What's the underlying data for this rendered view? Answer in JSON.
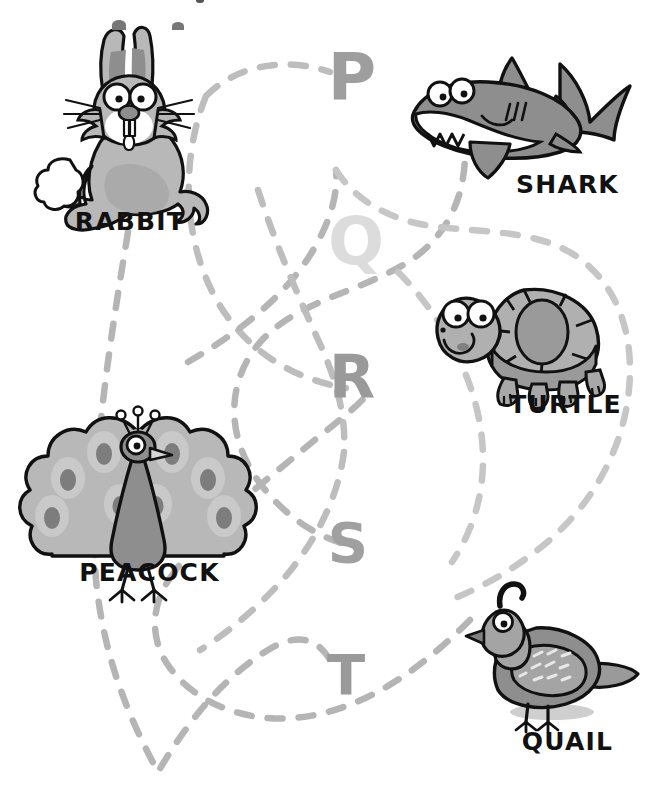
{
  "worksheet": {
    "type": "alphabet-match-worksheet",
    "width": 664,
    "height": 810,
    "background": "#ffffff",
    "line_color": "#b3b3b3",
    "letter_color": "#9a9a9a",
    "letter_color_faint": "#d9d9d9",
    "label_color": "#111111"
  },
  "letters": [
    {
      "id": "letter-p",
      "char": "P",
      "x": 352,
      "y": 72,
      "size": 62,
      "color": "#9e9e9e"
    },
    {
      "id": "letter-q",
      "char": "Q",
      "x": 354,
      "y": 237,
      "size": 62,
      "color": "#dcdcdc"
    },
    {
      "id": "letter-r",
      "char": "R",
      "x": 350,
      "y": 373,
      "size": 58,
      "color": "#9a9a9a"
    },
    {
      "id": "letter-s",
      "char": "S",
      "x": 346,
      "y": 541,
      "size": 52,
      "color": "#a0a0a0"
    },
    {
      "id": "letter-t",
      "char": "T",
      "x": 344,
      "y": 674,
      "size": 52,
      "color": "#9a9a9a"
    }
  ],
  "animals": [
    {
      "id": "rabbit",
      "label": "RABBIT",
      "label_x": 30,
      "label_y": 207,
      "label_w": 200
    },
    {
      "id": "shark",
      "label": "SHARK",
      "label_x": 470,
      "label_y": 170,
      "label_w": 195
    },
    {
      "id": "turtle",
      "label": "TURTLE",
      "label_x": 468,
      "label_y": 390,
      "label_w": 195
    },
    {
      "id": "peacock",
      "label": "PEACOCK",
      "label_x": 42,
      "label_y": 558,
      "label_w": 215
    },
    {
      "id": "quail",
      "label": "QUAIL",
      "label_x": 470,
      "label_y": 727,
      "label_w": 195
    }
  ],
  "connections": [
    {
      "id": "path-rabbit",
      "from": "rabbit",
      "to": "letter-t",
      "color": "#b5b5b5"
    },
    {
      "id": "path-shark",
      "from": "shark",
      "to": "letter-s",
      "color": "#b5b5b5"
    },
    {
      "id": "path-turtle",
      "from": "turtle",
      "to": "letter-p",
      "color": "#bdbdbd"
    },
    {
      "id": "path-peacock",
      "from": "peacock",
      "to": "letter-q",
      "color": "#b5b5b5"
    },
    {
      "id": "path-quail",
      "from": "quail",
      "to": "letter-r",
      "color": "#c6c6c6"
    }
  ]
}
